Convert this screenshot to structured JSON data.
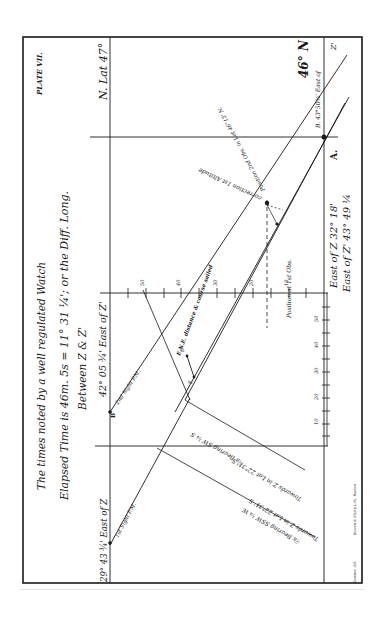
{
  "plate": {
    "title": "PLATE VII.",
    "header_line1": "The times noted by a well regulated Watch",
    "header_line2": "Elapsed Time is 46m. 5s = 11° 31 ¼'; or the Diff. Long.",
    "header_line3": "Between  Z & Z'",
    "lat_north": "N. Lat 47°",
    "lat_south": "46° N",
    "point_a": "A.",
    "point_b_label": "B. 43°50¾' East of",
    "z_prime_label": "Z'",
    "b_prime_label": "B'",
    "b_prime_long": "42° 05 ¾' East of Z'",
    "a_prime_long": "29° 43 ¾' East of Z",
    "east_of_z": "East of  Z 32° 18'",
    "east_of_z_prime": "East of Z' 43° 49 ¼",
    "position_2nd_obs": "Position 2nd Obs. in Lat 46°15' N.",
    "correction_1st_alt": "correction 1st Altitude",
    "position_1st_obs": "Position at 1st Obs.",
    "second_sight": "2nd Sight P.M.",
    "first_sight": "1st Sight P.M.",
    "run_label": "E.N.E. distance & course sailed",
    "d_label": "D",
    "e_label": "E",
    "bearing1": "☉s Bearing SW ¼ S",
    "towards1": "Towards Z in Lat 22°31' S",
    "bearing2": "☉s Bearing SSW ⅛ W.",
    "towards2": "Towards Z in Lat 22°31' S",
    "scale_ticks_top": [
      "50",
      "40",
      "30",
      "20",
      "10"
    ],
    "scale_ticks_side": [
      "10",
      "20",
      "30",
      "40",
      "50"
    ],
    "credit_left": "Sumner, del.",
    "credit_right": "Bowen & Sharp Lith.  Boston"
  },
  "colors": {
    "ink": "#1a1a1a",
    "paper": "#ffffff"
  }
}
